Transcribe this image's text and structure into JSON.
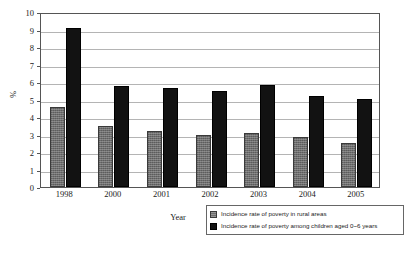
{
  "chart_data": {
    "type": "bar",
    "title": "",
    "subtitle": "",
    "xlabel": "Year",
    "ylabel": "%",
    "categories": [
      "1998",
      "2000",
      "2001",
      "2002",
      "2003",
      "2004",
      "2005"
    ],
    "series": [
      {
        "name": "Incidence rate of poverty in rural areas",
        "color": "#6e6e6e",
        "values": [
          4.6,
          3.5,
          3.2,
          3.0,
          3.1,
          2.85,
          2.5
        ]
      },
      {
        "name": "Incidence rate of poverty among children aged 0~6 years",
        "color": "#121212",
        "values": [
          9.1,
          5.75,
          5.65,
          5.5,
          5.85,
          5.2,
          5.05
        ]
      }
    ],
    "ylim": [
      0,
      10
    ],
    "ytick_labels": [
      "0",
      "1",
      "2",
      "3",
      "4",
      "5",
      "6",
      "7",
      "8",
      "9",
      "10"
    ],
    "grid": true,
    "legend_position": "bottom-right"
  },
  "axes": {
    "y_title": "%",
    "x_title": "Year"
  },
  "legend": {
    "entries": [
      {
        "label": "Incidence rate of poverty in rural areas",
        "swatch": "gray-hatched-swatch"
      },
      {
        "label": "Incidence rate of poverty among children aged 0~6 years",
        "swatch": "black-swatch"
      }
    ]
  }
}
